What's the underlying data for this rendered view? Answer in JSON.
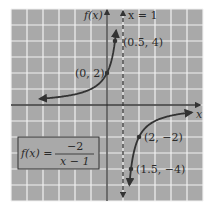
{
  "chart_data": {
    "type": "line",
    "title": "",
    "function": "f(x) = -2/(x-1)",
    "xlabel": "x",
    "ylabel": "f(x)",
    "xlim": [
      -6,
      6
    ],
    "ylim": [
      -6,
      6
    ],
    "grid": true,
    "asymptote": {
      "type": "vertical",
      "x": 1,
      "label": "x = 1",
      "style": "dashed"
    },
    "series": [
      {
        "name": "left branch",
        "x": [
          -4,
          -3,
          -2,
          -1,
          0,
          0.5
        ],
        "y": [
          0.4,
          0.5,
          0.667,
          1,
          2,
          4
        ]
      },
      {
        "name": "right branch",
        "x": [
          1.5,
          2,
          3,
          4,
          5
        ],
        "y": [
          -4,
          -2,
          -1,
          -0.667,
          -0.5
        ]
      }
    ],
    "points": [
      {
        "x": 0.5,
        "y": 4,
        "label": "(0.5, 4)"
      },
      {
        "x": 0,
        "y": 2,
        "label": "(0, 2)"
      },
      {
        "x": 2,
        "y": -2,
        "label": "(2, −2)"
      },
      {
        "x": 1.5,
        "y": -4,
        "label": "(1.5, −4)"
      }
    ],
    "annotations": [
      {
        "text": "f(x) = −2 / (x − 1)",
        "position": "lower-left boxed"
      }
    ]
  },
  "labels": {
    "y_axis": "f(x)",
    "x_axis": "x",
    "asymptote": "x = 1",
    "p1": "(0.5, 4)",
    "p2": "(0, 2)",
    "p3": "(2, −2)",
    "p4": "(1.5, −4)",
    "formula_lhs": "f(x) =",
    "formula_num": "−2",
    "formula_den": "x − 1"
  },
  "colors": {
    "background": "#a9a9a9",
    "grid": "#f2f2f2",
    "ink": "#333333"
  }
}
